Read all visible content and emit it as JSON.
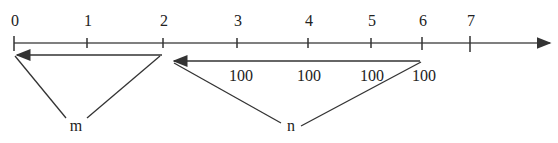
{
  "number_line": {
    "ticks": [
      {
        "label": "0",
        "x": 14
      },
      {
        "label": "1",
        "x": 87
      },
      {
        "label": "2",
        "x": 163
      },
      {
        "label": "3",
        "x": 237
      },
      {
        "label": "4",
        "x": 308
      },
      {
        "label": "5",
        "x": 371
      },
      {
        "label": "6",
        "x": 422
      },
      {
        "label": "7",
        "x": 470
      }
    ]
  },
  "segment_m": {
    "label": "m",
    "from": "2",
    "to": "0"
  },
  "segment_n": {
    "label": "n",
    "from": "6",
    "to": "2",
    "step_labels": [
      "100",
      "100",
      "100",
      "100"
    ]
  },
  "colors": {
    "stroke": "#333333",
    "axis": "#555555"
  }
}
